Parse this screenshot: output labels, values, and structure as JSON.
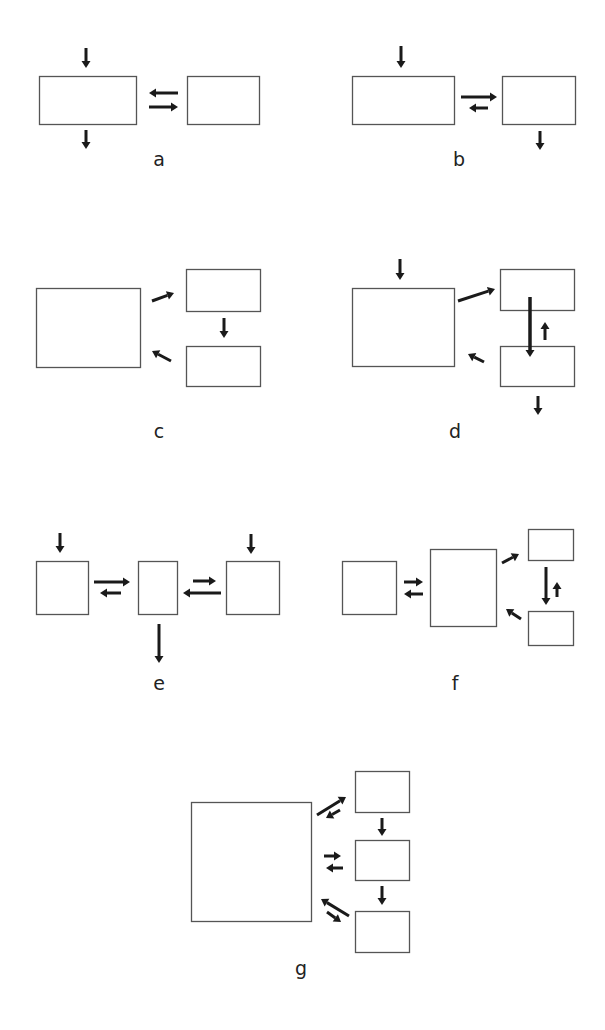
{
  "figure": {
    "width": 605,
    "height": 1030,
    "colors": {
      "box_stroke": "#555555",
      "arrow": "#1a1a1a",
      "label": "#222222",
      "background": "#ffffff"
    }
  },
  "panels": [
    {
      "id": "a",
      "label": "a",
      "label_pos": [
        159,
        166
      ],
      "boxes": [
        {
          "name": "compartment-1",
          "x": 39,
          "y": 76,
          "w": 97,
          "h": 48
        },
        {
          "name": "compartment-2",
          "x": 187,
          "y": 76,
          "w": 72,
          "h": 48
        }
      ],
      "arrows": [
        {
          "name": "input",
          "from": [
            86,
            48
          ],
          "to": [
            86,
            68
          ],
          "w": 3
        },
        {
          "name": "output",
          "from": [
            86,
            130
          ],
          "to": [
            86,
            149
          ],
          "w": 3
        },
        {
          "name": "flux-2-to-1",
          "from": [
            178,
            93
          ],
          "to": [
            149,
            93
          ],
          "w": 3
        },
        {
          "name": "flux-1-to-2",
          "from": [
            149,
            107
          ],
          "to": [
            178,
            107
          ],
          "w": 3
        }
      ]
    },
    {
      "id": "b",
      "label": "b",
      "label_pos": [
        459,
        166
      ],
      "boxes": [
        {
          "name": "compartment-1",
          "x": 352,
          "y": 76,
          "w": 102,
          "h": 48
        },
        {
          "name": "compartment-2",
          "x": 502,
          "y": 76,
          "w": 73,
          "h": 48
        }
      ],
      "arrows": [
        {
          "name": "input",
          "from": [
            401,
            46
          ],
          "to": [
            401,
            68
          ],
          "w": 3
        },
        {
          "name": "flux-1-to-2",
          "from": [
            461,
            97
          ],
          "to": [
            497,
            97
          ],
          "w": 3
        },
        {
          "name": "flux-2-to-1",
          "from": [
            488,
            108
          ],
          "to": [
            469,
            108
          ],
          "w": 3
        },
        {
          "name": "output",
          "from": [
            540,
            131
          ],
          "to": [
            540,
            150
          ],
          "w": 3
        }
      ]
    },
    {
      "id": "c",
      "label": "c",
      "label_pos": [
        159,
        438
      ],
      "boxes": [
        {
          "name": "compartment-1",
          "x": 36,
          "y": 288,
          "w": 104,
          "h": 79
        },
        {
          "name": "compartment-2",
          "x": 186,
          "y": 269,
          "w": 74,
          "h": 42
        },
        {
          "name": "compartment-3",
          "x": 186,
          "y": 346,
          "w": 74,
          "h": 40
        }
      ],
      "arrows": [
        {
          "name": "flux-1-to-2",
          "from": [
            152,
            301
          ],
          "to": [
            174,
            293
          ],
          "w": 3
        },
        {
          "name": "flux-2-to-3",
          "from": [
            224,
            318
          ],
          "to": [
            224,
            338
          ],
          "w": 3
        },
        {
          "name": "flux-3-to-1",
          "from": [
            171,
            361
          ],
          "to": [
            152,
            351
          ],
          "w": 3
        }
      ]
    },
    {
      "id": "d",
      "label": "d",
      "label_pos": [
        455,
        438
      ],
      "boxes": [
        {
          "name": "compartment-1",
          "x": 352,
          "y": 288,
          "w": 102,
          "h": 78
        },
        {
          "name": "compartment-2",
          "x": 500,
          "y": 269,
          "w": 74,
          "h": 41
        },
        {
          "name": "compartment-3",
          "x": 500,
          "y": 346,
          "w": 74,
          "h": 40
        }
      ],
      "arrows": [
        {
          "name": "input",
          "from": [
            400,
            259
          ],
          "to": [
            400,
            280
          ],
          "w": 3
        },
        {
          "name": "flux-1-to-2",
          "from": [
            458,
            301
          ],
          "to": [
            495,
            289
          ],
          "w": 3
        },
        {
          "name": "flux-2-to-3",
          "from": [
            530,
            297
          ],
          "to": [
            530,
            357
          ],
          "w": 3.5
        },
        {
          "name": "flux-3-to-2",
          "from": [
            545,
            340
          ],
          "to": [
            545,
            322
          ],
          "w": 3
        },
        {
          "name": "flux-3-to-1",
          "from": [
            484,
            362
          ],
          "to": [
            468,
            354
          ],
          "w": 3
        },
        {
          "name": "output",
          "from": [
            538,
            396
          ],
          "to": [
            538,
            415
          ],
          "w": 3
        }
      ]
    },
    {
      "id": "e",
      "label": "e",
      "label_pos": [
        159,
        690
      ],
      "boxes": [
        {
          "name": "compartment-1",
          "x": 36,
          "y": 561,
          "w": 52,
          "h": 53
        },
        {
          "name": "compartment-2",
          "x": 138,
          "y": 561,
          "w": 39,
          "h": 53
        },
        {
          "name": "compartment-3",
          "x": 226,
          "y": 561,
          "w": 53,
          "h": 53
        }
      ],
      "arrows": [
        {
          "name": "input-1",
          "from": [
            60,
            533
          ],
          "to": [
            60,
            553
          ],
          "w": 3
        },
        {
          "name": "flux-1-to-2",
          "from": [
            94,
            582
          ],
          "to": [
            130,
            582
          ],
          "w": 3
        },
        {
          "name": "flux-2-to-1",
          "from": [
            121,
            593
          ],
          "to": [
            100,
            593
          ],
          "w": 3
        },
        {
          "name": "input-3",
          "from": [
            251,
            534
          ],
          "to": [
            251,
            554
          ],
          "w": 3
        },
        {
          "name": "flux-3-to-2",
          "from": [
            221,
            593
          ],
          "to": [
            183,
            593
          ],
          "w": 3
        },
        {
          "name": "flux-2-to-3",
          "from": [
            193,
            581
          ],
          "to": [
            216,
            581
          ],
          "w": 3
        },
        {
          "name": "output",
          "from": [
            159,
            624
          ],
          "to": [
            159,
            663
          ],
          "w": 3
        }
      ]
    },
    {
      "id": "f",
      "label": "f",
      "label_pos": [
        455,
        690
      ],
      "boxes": [
        {
          "name": "compartment-1",
          "x": 342,
          "y": 561,
          "w": 54,
          "h": 53
        },
        {
          "name": "compartment-2",
          "x": 430,
          "y": 549,
          "w": 66,
          "h": 77
        },
        {
          "name": "compartment-3",
          "x": 528,
          "y": 529,
          "w": 45,
          "h": 31
        },
        {
          "name": "compartment-4",
          "x": 528,
          "y": 611,
          "w": 45,
          "h": 34
        }
      ],
      "arrows": [
        {
          "name": "flux-1-to-2",
          "from": [
            404,
            582
          ],
          "to": [
            423,
            582
          ],
          "w": 3
        },
        {
          "name": "flux-2-to-1",
          "from": [
            423,
            594
          ],
          "to": [
            404,
            594
          ],
          "w": 3
        },
        {
          "name": "flux-2-to-3",
          "from": [
            502,
            563
          ],
          "to": [
            519,
            554
          ],
          "w": 3
        },
        {
          "name": "flux-3-to-4",
          "from": [
            546,
            567
          ],
          "to": [
            546,
            605
          ],
          "w": 3
        },
        {
          "name": "flux-4-to-3",
          "from": [
            557,
            597
          ],
          "to": [
            557,
            582
          ],
          "w": 3
        },
        {
          "name": "flux-4-to-2",
          "from": [
            521,
            619
          ],
          "to": [
            506,
            609
          ],
          "w": 3
        }
      ]
    },
    {
      "id": "g",
      "label": "g",
      "label_pos": [
        301,
        975
      ],
      "boxes": [
        {
          "name": "compartment-1",
          "x": 191,
          "y": 802,
          "w": 120,
          "h": 119
        },
        {
          "name": "compartment-2",
          "x": 355,
          "y": 771,
          "w": 54,
          "h": 41
        },
        {
          "name": "compartment-3",
          "x": 355,
          "y": 840,
          "w": 54,
          "h": 40
        },
        {
          "name": "compartment-4",
          "x": 355,
          "y": 911,
          "w": 54,
          "h": 41
        }
      ],
      "arrows": [
        {
          "name": "flux-1-to-2",
          "from": [
            317,
            815
          ],
          "to": [
            346,
            797
          ],
          "w": 3
        },
        {
          "name": "flux-2-to-1",
          "from": [
            340,
            810
          ],
          "to": [
            326,
            818
          ],
          "w": 3
        },
        {
          "name": "flux-2-to-3",
          "from": [
            382,
            818
          ],
          "to": [
            382,
            836
          ],
          "w": 3
        },
        {
          "name": "flux-1-to-3",
          "from": [
            324,
            856
          ],
          "to": [
            341,
            856
          ],
          "w": 3
        },
        {
          "name": "flux-3-to-1",
          "from": [
            343,
            868
          ],
          "to": [
            326,
            868
          ],
          "w": 3
        },
        {
          "name": "flux-3-to-4",
          "from": [
            382,
            886
          ],
          "to": [
            382,
            905
          ],
          "w": 3
        },
        {
          "name": "flux-4-to-1",
          "from": [
            349,
            916
          ],
          "to": [
            321,
            899
          ],
          "w": 3
        },
        {
          "name": "flux-1-to-4",
          "from": [
            327,
            912
          ],
          "to": [
            341,
            922
          ],
          "w": 3
        }
      ]
    }
  ]
}
